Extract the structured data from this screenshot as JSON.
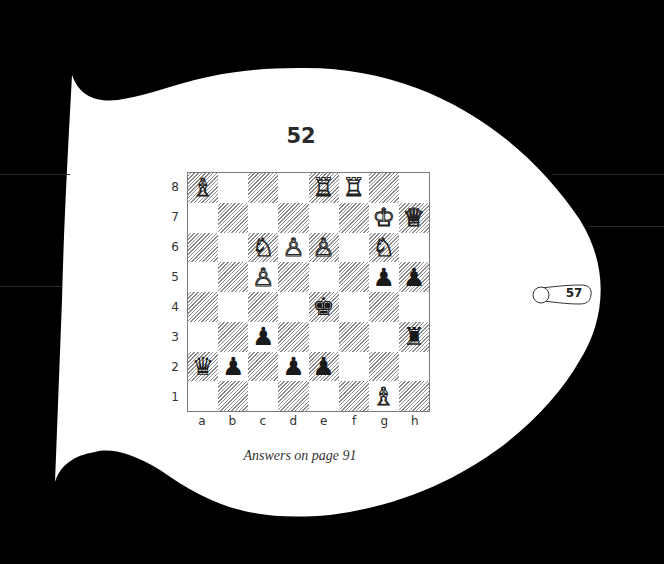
{
  "puzzle": {
    "number": "52",
    "caption": "Answers on page 91",
    "page_tab": "57"
  },
  "board": {
    "orientation": "white-bottom",
    "files": [
      "a",
      "b",
      "c",
      "d",
      "e",
      "f",
      "g",
      "h"
    ],
    "ranks": [
      "8",
      "7",
      "6",
      "5",
      "4",
      "3",
      "2",
      "1"
    ],
    "dark_square_style": "hatched",
    "pieces": [
      {
        "square": "a8",
        "color": "white",
        "type": "bishop",
        "glyph": "♗"
      },
      {
        "square": "e8",
        "color": "white",
        "type": "rook",
        "glyph": "♖"
      },
      {
        "square": "f8",
        "color": "white",
        "type": "rook",
        "glyph": "♖"
      },
      {
        "square": "g7",
        "color": "white",
        "type": "king",
        "glyph": "♔"
      },
      {
        "square": "h7",
        "color": "white",
        "type": "queen",
        "glyph": "♕"
      },
      {
        "square": "c6",
        "color": "white",
        "type": "knight",
        "glyph": "♘"
      },
      {
        "square": "d6",
        "color": "white",
        "type": "pawn",
        "glyph": "♙"
      },
      {
        "square": "e6",
        "color": "white",
        "type": "pawn",
        "glyph": "♙"
      },
      {
        "square": "g6",
        "color": "white",
        "type": "knight",
        "glyph": "♘"
      },
      {
        "square": "c5",
        "color": "white",
        "type": "pawn",
        "glyph": "♙"
      },
      {
        "square": "g5",
        "color": "black",
        "type": "pawn",
        "glyph": "♟"
      },
      {
        "square": "h5",
        "color": "black",
        "type": "pawn",
        "glyph": "♟"
      },
      {
        "square": "e4",
        "color": "black",
        "type": "king",
        "glyph": "♚"
      },
      {
        "square": "c3",
        "color": "black",
        "type": "pawn",
        "glyph": "♟"
      },
      {
        "square": "h3",
        "color": "black",
        "type": "rook",
        "glyph": "♜"
      },
      {
        "square": "a2",
        "color": "black",
        "type": "queen",
        "glyph": "♛"
      },
      {
        "square": "b2",
        "color": "black",
        "type": "pawn",
        "glyph": "♟"
      },
      {
        "square": "d2",
        "color": "black",
        "type": "pawn",
        "glyph": "♟"
      },
      {
        "square": "e2",
        "color": "black",
        "type": "pawn",
        "glyph": "♟"
      },
      {
        "square": "g1",
        "color": "white",
        "type": "bishop",
        "glyph": "♗"
      }
    ]
  },
  "colors": {
    "background": "#000000",
    "page": "#ffffff",
    "text": "#2a2a2a",
    "hatch": "#8c8c8c"
  }
}
